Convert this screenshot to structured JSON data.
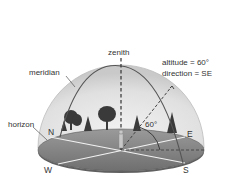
{
  "diagram": {
    "labels": {
      "zenith": "zenith",
      "meridian": "meridian",
      "horizon": "horizon",
      "altitude": "altitude = 60°",
      "direction": "direction = SE",
      "angle": "60°"
    },
    "compass": {
      "north": "N",
      "east": "E",
      "south": "S",
      "west": "W"
    },
    "colors": {
      "dome_fill": "#e2e2e2",
      "dome_edge": "#c8c8c8",
      "ground": "#8a8a8a",
      "ground_dark": "#6e6e6e",
      "meridian_line": "#555555",
      "trees": "#3a3a3a",
      "text": "#333333"
    }
  }
}
